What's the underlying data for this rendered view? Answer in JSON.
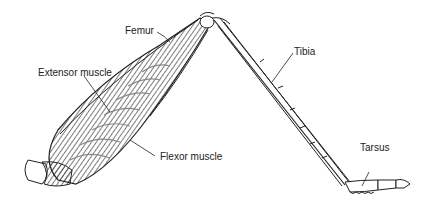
{
  "diagram": {
    "labels": {
      "femur": "Femur",
      "extensor": "Extensor muscle",
      "flexor": "Flexor muscle",
      "tibia": "Tibia",
      "tarsus": "Tarsus"
    },
    "colors": {
      "ink": "#222222",
      "muscle": "#555555",
      "background": "#ffffff"
    }
  }
}
